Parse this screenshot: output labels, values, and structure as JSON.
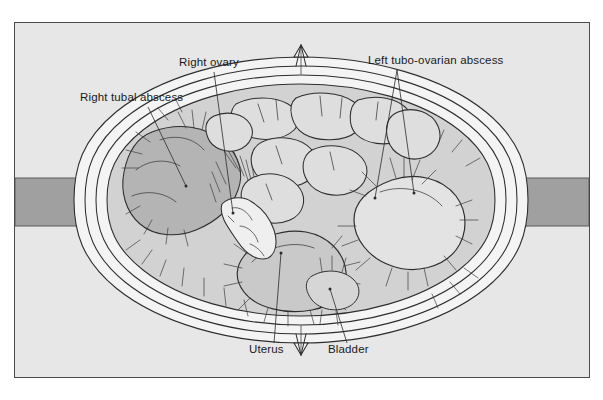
{
  "figure": {
    "panel": {
      "background_color": "#e7e7e7",
      "border_color": "#4a4a4a",
      "page_color": "#ffffff"
    },
    "palette": {
      "ink": "#2e2e2e",
      "pelvic_wall_gray": "#a0a0a0",
      "organ_mid_gray": "#c9c9c9",
      "organ_light_gray": "#dedede",
      "abscess_pale": "#e3e3e3",
      "right_abscess_dark": "#b4b4b4",
      "wall_band_white": "#f4f4f4",
      "label_text": "#1a1a1a"
    },
    "labels": [
      {
        "id": "right-tubal-abscess",
        "text": "Right tubal abscess",
        "text_x": 80,
        "text_y": 101,
        "anchor": "start",
        "leaders": [
          {
            "x1": 148,
            "y1": 107,
            "x2": 186,
            "y2": 186
          }
        ]
      },
      {
        "id": "right-ovary",
        "text": "Right ovary",
        "text_x": 179,
        "text_y": 66,
        "anchor": "start",
        "leaders": [
          {
            "x1": 214,
            "y1": 72,
            "x2": 233,
            "y2": 213
          }
        ]
      },
      {
        "id": "left-tubo-ovarian-abscess",
        "text": "Left tubo-ovarian abscess",
        "text_x": 368,
        "text_y": 64,
        "anchor": "start",
        "leaders": [
          {
            "x1": 397,
            "y1": 70,
            "x2": 375,
            "y2": 198
          },
          {
            "x1": 397,
            "y1": 70,
            "x2": 414,
            "y2": 193
          }
        ]
      },
      {
        "id": "uterus",
        "text": "Uterus",
        "text_x": 249,
        "text_y": 353,
        "anchor": "start",
        "leaders": [
          {
            "x1": 274,
            "y1": 343,
            "x2": 281,
            "y2": 253
          }
        ]
      },
      {
        "id": "bladder",
        "text": "Bladder",
        "text_x": 328,
        "text_y": 353,
        "anchor": "start",
        "leaders": [
          {
            "x1": 347,
            "y1": 343,
            "x2": 330,
            "y2": 289
          }
        ]
      }
    ]
  }
}
